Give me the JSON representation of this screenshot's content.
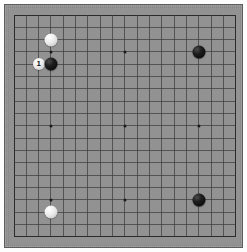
{
  "app": {
    "title": "Go Board",
    "board_type": "goban"
  },
  "board": {
    "size": 19,
    "columns": 19,
    "rows": 19,
    "wood_color": "#8f8f8f",
    "surface_color": "#929292",
    "line_color": "#3a3a3a",
    "edge_line_color": "#2b2b2b",
    "frame_border_color": "#5c5c5c",
    "page_background": "#fdfdfd",
    "geometry": {
      "grid_left": 14,
      "grid_top": 15,
      "cell_size": 12.33,
      "frame_left": 4,
      "frame_top": 4,
      "frame_width": 239,
      "frame_height": 244
    },
    "hoshi_points": [
      {
        "name": "hoshi-top-left",
        "col": 3,
        "row": 3
      },
      {
        "name": "hoshi-top-center",
        "col": 9,
        "row": 3
      },
      {
        "name": "hoshi-top-right",
        "col": 15,
        "row": 3
      },
      {
        "name": "hoshi-middle-left",
        "col": 3,
        "row": 9
      },
      {
        "name": "hoshi-center",
        "col": 9,
        "row": 9
      },
      {
        "name": "hoshi-middle-right",
        "col": 15,
        "row": 9
      },
      {
        "name": "hoshi-bottom-left",
        "col": 3,
        "row": 15
      },
      {
        "name": "hoshi-bottom-center",
        "col": 9,
        "row": 15
      },
      {
        "name": "hoshi-bottom-right",
        "col": 15,
        "row": 15
      }
    ]
  },
  "stones": [
    {
      "id": "stone-white-upper-left",
      "color": "white",
      "col": 3,
      "row": 2,
      "diameter": 13,
      "label": ""
    },
    {
      "id": "stone-white-move-1",
      "color": "white",
      "col": 2,
      "row": 4,
      "diameter": 12,
      "label": "1"
    },
    {
      "id": "stone-black-upper-left",
      "color": "black",
      "col": 3,
      "row": 4,
      "diameter": 13,
      "label": ""
    },
    {
      "id": "stone-black-upper-right",
      "color": "black",
      "col": 15,
      "row": 3,
      "diameter": 13,
      "label": ""
    },
    {
      "id": "stone-white-lower-left",
      "color": "white",
      "col": 3,
      "row": 16,
      "diameter": 13,
      "label": ""
    },
    {
      "id": "stone-black-lower-right",
      "color": "black",
      "col": 15,
      "row": 15,
      "diameter": 13,
      "label": ""
    }
  ],
  "colors": {
    "black_stone": "#050505",
    "white_stone": "#ececec",
    "label_on_white": "#161616",
    "label_on_black": "#f2f2f2"
  }
}
